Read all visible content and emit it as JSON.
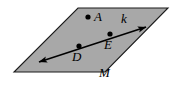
{
  "figure": {
    "type": "geometry-diagram",
    "background_color": "#ffffff",
    "plane": {
      "name": "plane-M",
      "label": "M",
      "fill_color": "#a8a8a8",
      "stroke_color": "#1a1a1a",
      "stroke_width": 1.1,
      "vertices": [
        {
          "x": 78,
          "y": 8
        },
        {
          "x": 168,
          "y": 8
        },
        {
          "x": 105,
          "y": 72
        },
        {
          "x": 14,
          "y": 72
        }
      ]
    },
    "line": {
      "name": "line-k",
      "label": "k",
      "color": "#000000",
      "stroke_width": 1.6,
      "arrow_both_ends": true,
      "start": {
        "x": 39,
        "y": 62
      },
      "end": {
        "x": 146,
        "y": 27
      }
    },
    "points": [
      {
        "id": "A",
        "label": "A",
        "x": 88,
        "y": 17,
        "radius": 2.6,
        "color": "#000000",
        "on_line": false
      },
      {
        "id": "E",
        "label": "E",
        "x": 110,
        "y": 34,
        "radius": 2.6,
        "color": "#000000",
        "on_line": true
      },
      {
        "id": "D",
        "label": "D",
        "x": 79,
        "y": 46,
        "radius": 2.6,
        "color": "#000000",
        "on_line": true
      }
    ],
    "labels": [
      {
        "id": "A",
        "text": "A"
      },
      {
        "id": "k",
        "text": "k"
      },
      {
        "id": "E",
        "text": "E"
      },
      {
        "id": "D",
        "text": "D"
      },
      {
        "id": "M",
        "text": "M"
      }
    ]
  }
}
